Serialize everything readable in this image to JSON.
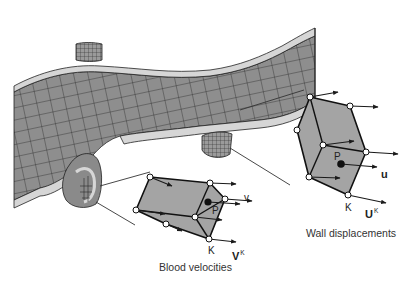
{
  "diagram": {
    "colors": {
      "mesh_fill": "#8c8c8c",
      "mesh_light": "#a8a8a8",
      "wall_band": "#d8d8d8",
      "element_fill": "#a0a0a0",
      "line": "#1a1a1a",
      "background": "#ffffff"
    },
    "fluid_element": {
      "caption": "Blood velocities",
      "point_label": "P",
      "node_label": "K",
      "field_label": "v",
      "node_field_label": "V",
      "node_field_sup": "K"
    },
    "wall_element": {
      "caption": "Wall displacements",
      "point_label": "P",
      "node_label": "K",
      "field_label": "u",
      "node_field_label": "U",
      "node_field_sup": "K"
    }
  }
}
